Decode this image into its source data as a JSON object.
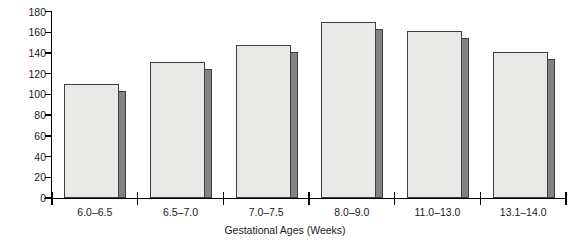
{
  "chart_data": {
    "type": "bar",
    "title": "",
    "xlabel": "Gestational Ages (Weeks)",
    "ylabel": "Beats/Min.",
    "categories": [
      "6.0–6.5",
      "6.5–7.0",
      "7.0–7.5",
      "8.0–9.0",
      "11.0–13.0",
      "13.1–14.0"
    ],
    "values": [
      110,
      131,
      148,
      170,
      161,
      141
    ],
    "ylim": [
      0,
      180
    ],
    "ytick_labels": [
      "0",
      "20",
      "40",
      "60",
      "80",
      "100",
      "120",
      "140",
      "160",
      "180"
    ],
    "ytick_values": [
      0,
      20,
      40,
      60,
      80,
      100,
      120,
      140,
      160,
      180
    ],
    "grid": "off",
    "legend": "none",
    "style": "3d-shaded-bars",
    "bar_front_color": "#e9e9e7",
    "bar_side_color": "#838383",
    "bar_edge_color": "#3d3d3d",
    "axis_color": "#000000"
  }
}
